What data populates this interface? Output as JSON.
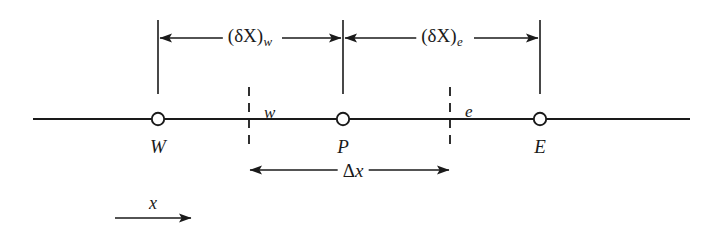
{
  "figure": {
    "background_color": "#ffffff",
    "line_color": "#1a1a1a",
    "axis_line": {
      "start_x": 33,
      "end_x": 690,
      "y": 119
    },
    "nodes": [
      {
        "id": "west",
        "label": "W",
        "x": 158,
        "y": 119,
        "marker": "open-circle"
      },
      {
        "id": "point",
        "label": "P",
        "x": 343,
        "y": 119,
        "marker": "open-circle"
      },
      {
        "id": "east",
        "label": "E",
        "x": 540,
        "y": 119,
        "marker": "open-circle"
      }
    ],
    "faces": [
      {
        "id": "west-face",
        "label": "w",
        "x": 249,
        "style": "dashed",
        "top_y": 87,
        "bottom_y": 150
      },
      {
        "id": "east-face",
        "label": "e",
        "x": 450,
        "style": "dashed",
        "top_y": 87,
        "bottom_y": 150
      }
    ],
    "reference_lines": [
      {
        "id": "ref-W",
        "x": 158,
        "top_y": 20,
        "bottom_y": 94
      },
      {
        "id": "ref-P",
        "x": 343,
        "top_y": 20,
        "bottom_y": 94
      },
      {
        "id": "ref-E",
        "x": 540,
        "top_y": 20,
        "bottom_y": 94
      }
    ],
    "dimensions": [
      {
        "id": "delta-x-west",
        "label_plain": "(δX)w",
        "label_main": "(δX)",
        "label_sub": "w",
        "from_x": 158,
        "to_x": 343,
        "y": 38,
        "arrows": "both",
        "label_x": 250,
        "label_y": 38
      },
      {
        "id": "delta-x-east",
        "label_plain": "(δX)e",
        "label_main": "(δX)",
        "label_sub": "e",
        "from_x": 343,
        "to_x": 540,
        "y": 38,
        "arrows": "both",
        "label_x": 442,
        "label_y": 38
      },
      {
        "id": "cell-width",
        "label_plain": "Δx",
        "label_main": "Δ",
        "label_sub": "",
        "label_italic": "x",
        "from_x": 249,
        "to_x": 450,
        "y": 170,
        "arrows": "both",
        "label_x": 350,
        "label_y": 170
      }
    ],
    "axis_indicator": {
      "id": "x-direction",
      "label": "x",
      "from_x": 115,
      "to_x": 192,
      "y": 218,
      "label_x": 153,
      "label_y": 203,
      "arrows": "right"
    }
  }
}
